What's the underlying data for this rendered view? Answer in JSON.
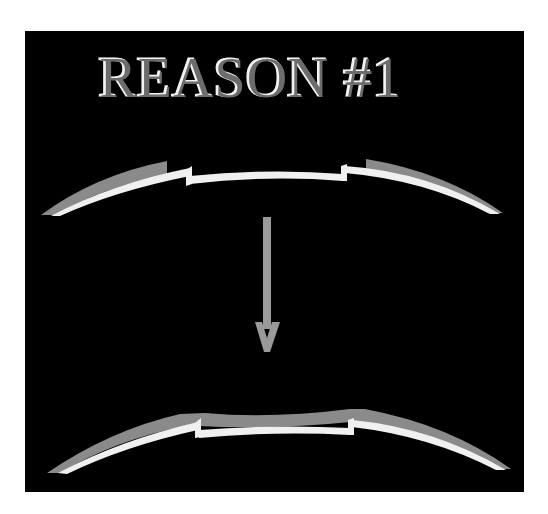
{
  "title": "REASON #1",
  "colors": {
    "background": "#ffffff",
    "panel": "#000000",
    "title_fill": "#6e6e6e",
    "title_highlight": "#f2f2f2",
    "band_white": "#f0f0f0",
    "band_grey": "#8a8a8a",
    "arrow": "#9a9a9a"
  },
  "diagram": {
    "top_shape": {
      "label": "before",
      "description": "curved white band with step notches; grey thickened sections on both outer flanks"
    },
    "arrow": {
      "direction": "down"
    },
    "bottom_shape": {
      "label": "after",
      "description": "curved white band with step notches; grey layer filling the central section and flanks"
    }
  }
}
